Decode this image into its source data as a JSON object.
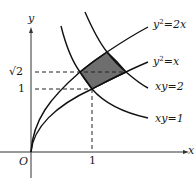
{
  "diagram": {
    "axes": {
      "x_label": "x",
      "y_label": "y",
      "origin_label": "O"
    },
    "ticks": {
      "x_one": "1",
      "y_one": "1",
      "y_sqrt2": "√2"
    },
    "curves": {
      "parabola_wide": {
        "lhs": "y",
        "exp": "2",
        "rhs": "=2x"
      },
      "parabola_narrow": {
        "lhs": "y",
        "exp": "2",
        "rhs": "=x"
      },
      "hyperbola_2": {
        "label": "xy=2"
      },
      "hyperbola_1": {
        "label": "xy=1"
      }
    },
    "region": {
      "fill": "#6e6e6e",
      "description": "region bounded by y²=x, y²=2x, xy=1, xy=2"
    }
  }
}
